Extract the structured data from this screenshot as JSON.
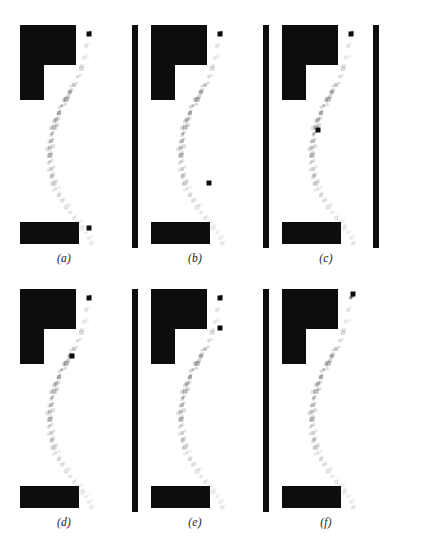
{
  "figure": {
    "width": 428,
    "height": 536,
    "background": "#ffffff",
    "ink_color": "#0d0d0d",
    "rows": 2,
    "cols": 3,
    "panel_width": 128,
    "panel_height": 268
  },
  "chart_data": {
    "type": "scatter",
    "title": "",
    "xlabel": "",
    "ylabel": "",
    "axis_ranges": {
      "x": [
        0,
        128
      ],
      "y": [
        0,
        244
      ]
    },
    "grid": false,
    "legend": "none",
    "trajectory_x": [
      89,
      86,
      84,
      81,
      78,
      74,
      70,
      66,
      62,
      59,
      56,
      54,
      52,
      51,
      50,
      50,
      50,
      51,
      52,
      54,
      56,
      59,
      62,
      66,
      70,
      74,
      78,
      82,
      86,
      89,
      91
    ],
    "trajectory_y": [
      26,
      38,
      50,
      60,
      69,
      77,
      84,
      91,
      98,
      105,
      112,
      119,
      126,
      133,
      140,
      147,
      154,
      161,
      168,
      175,
      181,
      187,
      193,
      199,
      205,
      210,
      215,
      220,
      225,
      230,
      236
    ],
    "trajectory_opacity": [
      1.0,
      0.12,
      0.1,
      0.16,
      0.2,
      0.26,
      0.3,
      0.34,
      0.34,
      0.34,
      0.32,
      0.3,
      0.3,
      0.3,
      0.28,
      0.26,
      0.24,
      0.22,
      0.2,
      0.18,
      0.16,
      0.14,
      0.13,
      0.12,
      0.11,
      0.1,
      0.1,
      0.09,
      0.09,
      0.08,
      0.08
    ]
  },
  "geometry": {
    "obstacle_l": {
      "name": "L-shaped obstacle",
      "x": 20,
      "y": 17,
      "width": 56,
      "height": 75,
      "notch": {
        "x": 24,
        "y": 40,
        "width": 32,
        "height": 35
      }
    },
    "bar_bottom": {
      "name": "lower horizontal obstacle",
      "x": 20,
      "y": 214,
      "width": 59,
      "height": 22
    },
    "bar_vert": {
      "name": "right vertical wall",
      "x": 111,
      "y": 17,
      "width": 6,
      "height": 223
    }
  },
  "panels": [
    {
      "id": "panel-a",
      "caption": "(a)",
      "row": 0,
      "col": 0,
      "left": 0,
      "top": 8,
      "has_left_wall": false,
      "has_right_wall": false,
      "highlights": [
        {
          "x": 89,
          "y": 26,
          "size": 5
        },
        {
          "x": 89,
          "y": 220,
          "size": 5
        }
      ]
    },
    {
      "id": "panel-b",
      "caption": "(b)",
      "row": 0,
      "col": 1,
      "left": 131,
      "top": 8,
      "has_left_wall": true,
      "has_right_wall": false,
      "highlights": [
        {
          "x": 89,
          "y": 26,
          "size": 5
        },
        {
          "x": 78,
          "y": 175,
          "size": 5
        }
      ]
    },
    {
      "id": "panel-c",
      "caption": "(c)",
      "row": 0,
      "col": 2,
      "left": 262,
      "top": 8,
      "has_left_wall": true,
      "has_right_wall": true,
      "highlights": [
        {
          "x": 89,
          "y": 26,
          "size": 5
        },
        {
          "x": 56,
          "y": 122,
          "size": 5
        }
      ]
    },
    {
      "id": "panel-d",
      "caption": "(d)",
      "row": 1,
      "col": 0,
      "left": 0,
      "top": 272,
      "has_left_wall": false,
      "has_right_wall": false,
      "highlights": [
        {
          "x": 89,
          "y": 26,
          "size": 5
        },
        {
          "x": 72,
          "y": 84,
          "size": 5
        }
      ]
    },
    {
      "id": "panel-e",
      "caption": "(e)",
      "row": 1,
      "col": 1,
      "left": 131,
      "top": 272,
      "has_left_wall": true,
      "has_right_wall": false,
      "highlights": [
        {
          "x": 89,
          "y": 26,
          "size": 5
        },
        {
          "x": 89,
          "y": 56,
          "size": 5
        }
      ]
    },
    {
      "id": "panel-f",
      "caption": "(f)",
      "row": 1,
      "col": 2,
      "left": 262,
      "top": 272,
      "has_left_wall": true,
      "has_right_wall": false,
      "highlights": [
        {
          "x": 91,
          "y": 22,
          "size": 5
        }
      ]
    }
  ]
}
